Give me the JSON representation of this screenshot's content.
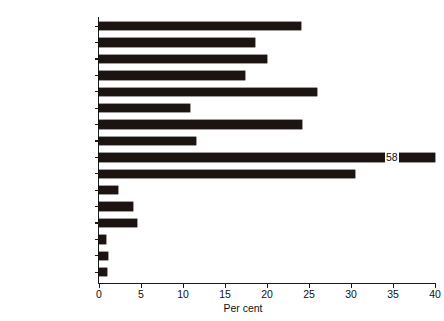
{
  "chart_data": {
    "type": "bar",
    "orientation": "horizontal",
    "title": "",
    "xlabel": "Per cent",
    "ylabel": "",
    "xlim": [
      0,
      40
    ],
    "xticks": [
      0,
      5,
      10,
      15,
      20,
      25,
      30,
      35,
      40
    ],
    "xtick_labels": [
      "0",
      "5",
      "10",
      "15",
      "20",
      "25",
      "30",
      "35",
      "40"
    ],
    "grid": false,
    "legend": null,
    "bar_color": "#1c1410",
    "categories": [
      "Wheat",
      "Maize",
      "Barley",
      "Oats",
      "Soybeans",
      "Rapeseed",
      "Sugar (raw)",
      "Potatoes (frozen)",
      "Cottonseed",
      "Coffee",
      "Butter",
      "Cheese",
      "Milk powder",
      "Pig meat",
      "Beef and veal",
      "Poultry meat"
    ],
    "values": [
      24,
      18.6,
      20,
      17.4,
      26,
      10.8,
      24.2,
      11.5,
      58,
      30.5,
      2.3,
      4,
      4.5,
      0.8,
      1.1,
      1
    ],
    "annotations": [
      {
        "category": "Cottonseed",
        "label": "58",
        "note": "bar truncated at axis maximum; value printed inside bar"
      }
    ]
  }
}
